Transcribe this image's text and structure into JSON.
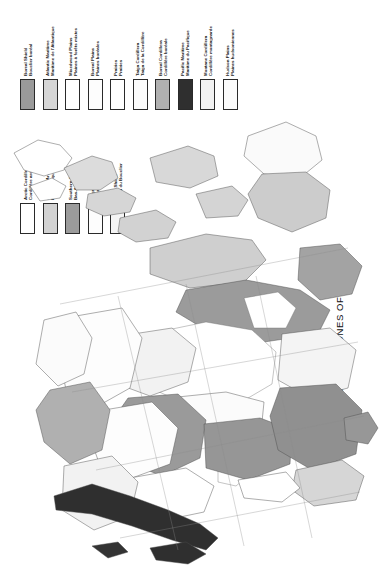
{
  "title": "TERRESTRIAL ECOZONES OF CANADA",
  "legend_primary": {
    "name": "primary-ecozone-legend",
    "entries": [
      {
        "label": "Boreal Shield\nBouclier boréal",
        "color": "#9a9a9a"
      },
      {
        "label": "Atlantic Maritime\nMaritime de l'Atlantique",
        "color": "#d6d6d6"
      },
      {
        "label": "Mixedwood Plains\nPlaines à forêts mixtes",
        "color": "#ffffff"
      },
      {
        "label": "Boreal Plains\nPlaines boréales",
        "color": "#fdfdfd"
      },
      {
        "label": "Prairies\nPrairies",
        "color": "#ffffff"
      },
      {
        "label": "Taiga Cordillera\nTaïga de la Cordillère",
        "color": "#fbfbfb"
      },
      {
        "label": "Boreal Cordillera\nCordillère boréale",
        "color": "#b0b0b0"
      },
      {
        "label": "Pacific Maritime\nMaritime du Pacifique",
        "color": "#2f2f2f"
      },
      {
        "label": "Montane Cordillera\nCordillère montagnarde",
        "color": "#f2f2f2"
      },
      {
        "label": "Hudson Plains\nPlaines hudsoniennes",
        "color": "#fbfbfb"
      }
    ]
  },
  "legend_secondary": {
    "name": "secondary-ecozone-legend",
    "entries": [
      {
        "label": "Arctic Cordillera\nCordillère arctique",
        "color": "#ffffff"
      },
      {
        "label": "Northern Arctic\nHaut-Arctique",
        "color": "#d2d2d2"
      },
      {
        "label": "Southern Arctic\nBas-Arctique",
        "color": "#9b9b9b"
      },
      {
        "label": "Taiga Plains\nTaïga des plaines",
        "color": "#fdfdfd"
      },
      {
        "label": "Taiga Shield\nTaïga du Bouclier",
        "color": "#f4f4f4"
      }
    ]
  },
  "map": {
    "name": "canada-ecozone-map",
    "orientation": "rotated-90-ccw",
    "water_body": "Hudson Bay"
  }
}
